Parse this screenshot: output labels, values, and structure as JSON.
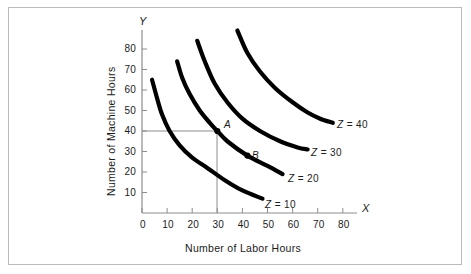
{
  "figure": {
    "background": "#ffffff",
    "frame_color": "#b9bcbe",
    "curve_color": "#000000",
    "axis_color": "#8a8d8f",
    "text_color": "#1b1b1b"
  },
  "axes": {
    "x_letter": "X",
    "y_letter": "Y",
    "x_title": "Number of Labor Hours",
    "y_title": "Number of Machine Hours",
    "x_ticks": [
      "0",
      "10",
      "20",
      "30",
      "40",
      "50",
      "60",
      "70",
      "80"
    ],
    "y_ticks": [
      "10",
      "20",
      "30",
      "40",
      "50",
      "60",
      "70",
      "80"
    ]
  },
  "points": [
    {
      "label": "A",
      "x": 30,
      "y": 40
    },
    {
      "label": "B",
      "x": 42,
      "y": 28
    }
  ],
  "curve_labels": [
    {
      "z": "Z",
      "eq": "= 10"
    },
    {
      "z": "Z",
      "eq": "= 20"
    },
    {
      "z": "Z",
      "eq": "= 30"
    },
    {
      "z": "Z",
      "eq": "= 40"
    }
  ],
  "chart_data": {
    "type": "line",
    "title": "",
    "xlabel": "Number of Labor Hours",
    "ylabel": "Number of Machine Hours",
    "xlim": [
      0,
      85
    ],
    "ylim": [
      0,
      88
    ],
    "grid": false,
    "legend": "inline-right-of-curve-ends",
    "xticks": [
      0,
      10,
      20,
      30,
      40,
      50,
      60,
      70,
      80
    ],
    "yticks": [
      10,
      20,
      30,
      40,
      50,
      60,
      70,
      80
    ],
    "annotations": [
      {
        "text": "A",
        "x": 30,
        "y": 40,
        "note": "point on Z = 20 isoquant with dropline to x=30 and y=40"
      },
      {
        "text": "B",
        "x": 42,
        "y": 28,
        "note": "point on Z = 20 isoquant"
      }
    ],
    "reference_lines": [
      {
        "type": "horizontal",
        "y": 40,
        "from_x": 0,
        "to_x": 30
      },
      {
        "type": "vertical",
        "x": 30,
        "from_y": 0,
        "to_y": 40
      }
    ],
    "series": [
      {
        "name": "Z = 10",
        "x": [
          4,
          6,
          8,
          11,
          15,
          20,
          26,
          33,
          40,
          48
        ],
        "y": [
          65,
          56,
          48,
          40,
          33,
          27,
          22,
          16,
          11,
          7
        ]
      },
      {
        "name": "Z = 20",
        "x": [
          14,
          16,
          19,
          23,
          27,
          30,
          34,
          42,
          50,
          56
        ],
        "y": [
          74,
          66,
          58,
          50,
          44,
          40,
          35,
          28,
          23,
          19
        ]
      },
      {
        "name": "Z = 30",
        "x": [
          22,
          25,
          29,
          34,
          40,
          47,
          55,
          62,
          66
        ],
        "y": [
          84,
          74,
          63,
          54,
          46,
          40,
          35,
          32,
          31
        ]
      },
      {
        "name": "Z = 40",
        "x": [
          38,
          42,
          47,
          53,
          60,
          66,
          71,
          76
        ],
        "y": [
          89,
          78,
          69,
          61,
          54,
          49,
          46,
          44
        ]
      }
    ]
  }
}
